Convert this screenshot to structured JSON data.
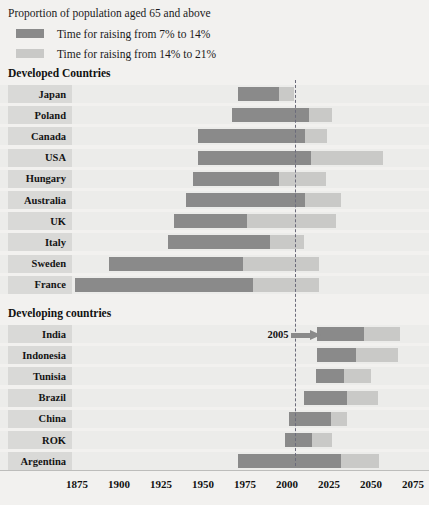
{
  "header": {
    "title": "Proportion of population aged 65 and above",
    "legend": [
      {
        "label": "Time for raising from 7% to 14%",
        "color": "#8a8a8a",
        "key": "7to14"
      },
      {
        "label": "Time for raising from 14% to 21%",
        "color": "#c9c9c7",
        "key": "14to21"
      }
    ]
  },
  "groups": [
    {
      "title": "Developed Countries"
    },
    {
      "title": "Developing countries"
    }
  ],
  "annotation": {
    "label": "2005",
    "year": 2005
  },
  "axis": {
    "ticks": [
      "1875",
      "1900",
      "1925",
      "1950",
      "1975",
      "2000",
      "2025",
      "2050",
      "2075"
    ],
    "min": 1875,
    "max": 2075,
    "step": 25
  },
  "chart_data": {
    "type": "bar",
    "orientation": "horizontal",
    "subtype": "stacked-range / gantt",
    "title": "Proportion of population aged 65 and above",
    "xlabel": "Year",
    "ylabel": "",
    "xlim": [
      1875,
      2075
    ],
    "grid": false,
    "legend_position": "top-left",
    "reference_line": {
      "year": 2005,
      "style": "dashed",
      "label": "2005"
    },
    "series": [
      {
        "name": "Time for raising from 7% to 14%",
        "color": "#8a8a8a"
      },
      {
        "name": "Time for raising from 14% to 21%",
        "color": "#c9c9c7"
      }
    ],
    "groups": [
      {
        "name": "Developed Countries",
        "items": [
          {
            "label": "Japan",
            "start_7pct": 1971,
            "reach_14pct": 1995,
            "reach_21pct": 2004
          },
          {
            "label": "Poland",
            "start_7pct": 1967,
            "reach_14pct": 2013,
            "reach_21pct": 2027
          },
          {
            "label": "Canada",
            "start_7pct": 1947,
            "reach_14pct": 2011,
            "reach_21pct": 2024
          },
          {
            "label": "USA",
            "start_7pct": 1947,
            "reach_14pct": 2014,
            "reach_21pct": 2057
          },
          {
            "label": "Hungary",
            "start_7pct": 1944,
            "reach_14pct": 1995,
            "reach_21pct": 2023
          },
          {
            "label": "Australia",
            "start_7pct": 1940,
            "reach_14pct": 2011,
            "reach_21pct": 2032
          },
          {
            "label": "UK",
            "start_7pct": 1933,
            "reach_14pct": 1976,
            "reach_21pct": 2029
          },
          {
            "label": "Italy",
            "start_7pct": 1929,
            "reach_14pct": 1990,
            "reach_21pct": 2010
          },
          {
            "label": "Sweden",
            "start_7pct": 1894,
            "reach_14pct": 1974,
            "reach_21pct": 2019
          },
          {
            "label": "France",
            "start_7pct": 1874,
            "reach_14pct": 1980,
            "reach_21pct": 2019
          }
        ]
      },
      {
        "name": "Developing countries",
        "items": [
          {
            "label": "India",
            "start_7pct": 2018,
            "reach_14pct": 2046,
            "reach_21pct": 2067
          },
          {
            "label": "Indonesia",
            "start_7pct": 2018,
            "reach_14pct": 2041,
            "reach_21pct": 2066
          },
          {
            "label": "Tunisia",
            "start_7pct": 2017,
            "reach_14pct": 2034,
            "reach_21pct": 2050
          },
          {
            "label": "Brazil",
            "start_7pct": 2010,
            "reach_14pct": 2036,
            "reach_21pct": 2054
          },
          {
            "label": "China",
            "start_7pct": 2001,
            "reach_14pct": 2026,
            "reach_21pct": 2036
          },
          {
            "label": "ROK",
            "start_7pct": 1999,
            "reach_14pct": 2015,
            "reach_21pct": 2027
          },
          {
            "label": "Argentina",
            "start_7pct": 1971,
            "reach_14pct": 2032,
            "reach_21pct": 2055
          }
        ]
      }
    ]
  }
}
